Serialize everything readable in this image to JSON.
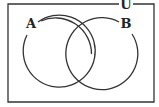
{
  "diagram": {
    "type": "venn",
    "universe_label": "U",
    "sets": [
      {
        "label": "A",
        "cx": 55.5,
        "cy": 54,
        "r": 36
      },
      {
        "label": "B",
        "cx": 103.5,
        "cy": 54,
        "r": 36
      }
    ],
    "colors": {
      "stroke": "#333333",
      "background": "#ffffff"
    }
  }
}
